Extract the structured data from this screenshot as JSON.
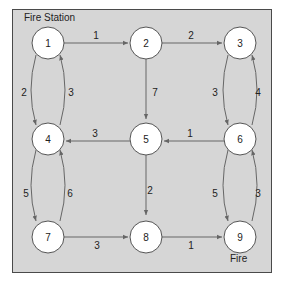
{
  "diagram": {
    "title_label": "Fire Station",
    "fire_label": "Fire",
    "colors": {
      "background": "#d6d6d6",
      "frame": "#4a4a4a",
      "node_fill": "#ffffff",
      "edge": "#666666"
    },
    "nodes": [
      {
        "id": "1",
        "label": "1",
        "x": 48,
        "y": 43
      },
      {
        "id": "2",
        "label": "2",
        "x": 146,
        "y": 43
      },
      {
        "id": "3",
        "label": "3",
        "x": 240,
        "y": 43
      },
      {
        "id": "4",
        "label": "4",
        "x": 48,
        "y": 137
      },
      {
        "id": "5",
        "label": "5",
        "x": 146,
        "y": 137
      },
      {
        "id": "6",
        "label": "6",
        "x": 240,
        "y": 137
      },
      {
        "id": "7",
        "label": "7",
        "x": 48,
        "y": 233
      },
      {
        "id": "8",
        "label": "8",
        "x": 146,
        "y": 233
      },
      {
        "id": "9",
        "label": "9",
        "x": 240,
        "y": 233
      }
    ],
    "edges": [
      {
        "from": "1",
        "to": "2",
        "weight": "1"
      },
      {
        "from": "2",
        "to": "3",
        "weight": "2"
      },
      {
        "from": "1",
        "to": "4",
        "weight": "2"
      },
      {
        "from": "4",
        "to": "1",
        "weight": "3"
      },
      {
        "from": "2",
        "to": "5",
        "weight": "7"
      },
      {
        "from": "3",
        "to": "6",
        "weight": "3"
      },
      {
        "from": "6",
        "to": "3",
        "weight": "4"
      },
      {
        "from": "5",
        "to": "4",
        "weight": "3"
      },
      {
        "from": "6",
        "to": "5",
        "weight": "1"
      },
      {
        "from": "4",
        "to": "7",
        "weight": "5"
      },
      {
        "from": "7",
        "to": "4",
        "weight": "6"
      },
      {
        "from": "5",
        "to": "8",
        "weight": "2"
      },
      {
        "from": "6",
        "to": "9",
        "weight": "5"
      },
      {
        "from": "9",
        "to": "6",
        "weight": "3"
      },
      {
        "from": "7",
        "to": "8",
        "weight": "3"
      },
      {
        "from": "8",
        "to": "9",
        "weight": "1"
      }
    ]
  }
}
